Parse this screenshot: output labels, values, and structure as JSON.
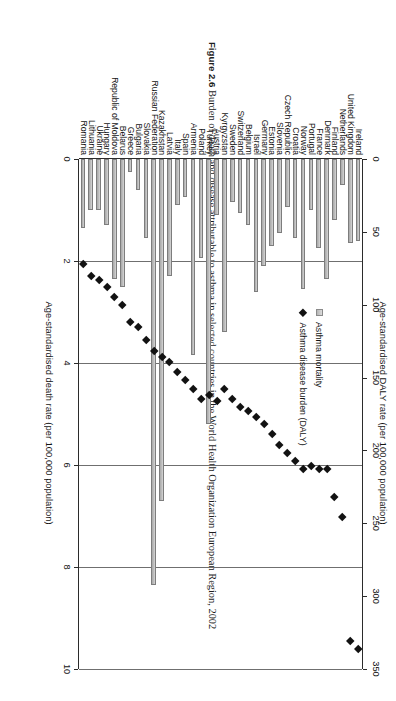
{
  "caption": {
    "figure_number": "Figure 2.6",
    "text": "Burden of death and disease attributable to asthma in selected countries in the World Health Organization European Region, 2002"
  },
  "legend": {
    "position": "top-left-inside-plot",
    "items": [
      {
        "label": "Asthma mortality",
        "marker": "square-icon",
        "color": "#c3c3c3"
      },
      {
        "label": "Asthma disease burden (DALY)",
        "marker": "diamond-icon",
        "color": "#121212"
      }
    ]
  },
  "chart_data": {
    "type": "bar",
    "title": "Burden of death and disease attributable to asthma in selected countries in the World Health Organization European Region, 2002",
    "grid": true,
    "xlabel": "",
    "ylabel": "Age-standardised death rate (per 100,000 population)",
    "ylabel_secondary": "Age-standardised DALY rate (per 100,000 population)",
    "ylim": [
      0,
      10
    ],
    "ylim_secondary": [
      0,
      350
    ],
    "yticks": [
      0,
      2,
      4,
      6,
      8,
      10
    ],
    "yticks_secondary": [
      0,
      50,
      100,
      150,
      200,
      250,
      300,
      350
    ],
    "categories": [
      "Ireland",
      "United Kingdom",
      "Netherlands",
      "Finland",
      "Denmark",
      "France",
      "Portugal",
      "Norway",
      "Croatia",
      "Czech Republic",
      "Slovenia",
      "Estonia",
      "Germany",
      "Israel",
      "Belgium",
      "Switzerland",
      "Sweden",
      "Kyrgyzstan",
      "Austria",
      "Turkey",
      "Poland",
      "Armenia",
      "Spain",
      "Italy",
      "Latvia",
      "Kazakhstan",
      "Russian Federation",
      "Slovakia",
      "Bulgaria",
      "Greece",
      "Belarus",
      "Republic of Moldova",
      "Hungary",
      "Ukraine",
      "Lithuania",
      "Romania"
    ],
    "series": [
      {
        "name": "Asthma mortality",
        "axis": "primary",
        "units": "per 100,000 population",
        "render": "bar",
        "values": [
          1.6,
          1.65,
          0.5,
          1.2,
          2.35,
          1.75,
          1.0,
          2.55,
          1.55,
          0.95,
          1.45,
          1.7,
          2.1,
          2.6,
          1.3,
          1.05,
          0.85,
          3.4,
          1.1,
          5.2,
          1.95,
          3.85,
          0.75,
          0.9,
          2.3,
          6.7,
          8.35,
          1.55,
          0.6,
          0.25,
          2.5,
          2.35,
          1.3,
          1.0,
          1.0,
          1.35
        ]
      },
      {
        "name": "Asthma disease burden (DALY)",
        "axis": "secondary",
        "units": "per 100,000 population",
        "render": "scatter-diamond",
        "values": [
          336,
          331,
          246,
          232,
          213,
          213,
          211,
          213,
          207,
          202,
          196,
          189,
          182,
          177,
          173,
          170,
          165,
          158,
          166,
          162,
          165,
          158,
          152,
          146,
          139,
          136,
          132,
          124,
          115,
          112,
          100,
          95,
          88,
          83,
          80,
          72
        ]
      }
    ]
  }
}
